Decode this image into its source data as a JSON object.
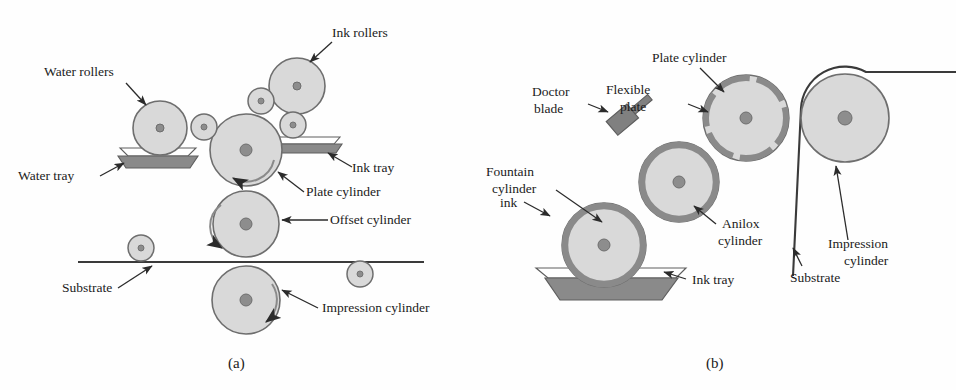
{
  "figure": {
    "type": "technical-diagram",
    "captions": {
      "a": "(a)",
      "b": "(b)"
    }
  },
  "colors": {
    "cylinder_fill": "#d9d9d9",
    "cylinder_stroke": "#6e6e6e",
    "hub": "#8d8d8d",
    "ink_dark": "#7a7a7a",
    "tray_dark": "#777777",
    "line": "#3a3a3a",
    "text": "#1b1b1b",
    "background": "#fefefe"
  },
  "panel_a": {
    "caption": "(a)",
    "title": "Offset lithographic press",
    "labels": [
      {
        "id": "water-rollers",
        "text": "Water rollers",
        "x": 44,
        "y": 76,
        "anchor": "start"
      },
      {
        "id": "ink-rollers",
        "text": "Ink rollers",
        "x": 332,
        "y": 37,
        "anchor": "start"
      },
      {
        "id": "water-tray",
        "text": "Water tray",
        "x": 18,
        "y": 180,
        "anchor": "start"
      },
      {
        "id": "ink-tray",
        "text": "Ink tray",
        "x": 352,
        "y": 172,
        "anchor": "start"
      },
      {
        "id": "plate-cylinder",
        "text": "Plate cylinder",
        "x": 306,
        "y": 196,
        "anchor": "start"
      },
      {
        "id": "offset-cylinder",
        "text": "Offset cylinder",
        "x": 330,
        "y": 224,
        "anchor": "start"
      },
      {
        "id": "substrate",
        "text": "Substrate",
        "x": 62,
        "y": 292,
        "anchor": "start"
      },
      {
        "id": "impression-cylinder",
        "text": "Impression cylinder",
        "x": 322,
        "y": 312,
        "anchor": "start"
      }
    ],
    "cylinders": [
      {
        "id": "water-roller-large",
        "cx": 160,
        "cy": 128,
        "r": 27,
        "hub": 4
      },
      {
        "id": "water-transfer-roller",
        "cx": 204,
        "cy": 127,
        "r": 13,
        "hub": 3
      },
      {
        "id": "plate-cylinder",
        "cx": 246,
        "cy": 150,
        "r": 36,
        "hub": 6
      },
      {
        "id": "ink-roller-large",
        "cx": 297,
        "cy": 86,
        "r": 28,
        "hub": 4
      },
      {
        "id": "ink-roller-small-left",
        "cx": 261,
        "cy": 101,
        "r": 13,
        "hub": 3
      },
      {
        "id": "ink-roller-small-low",
        "cx": 293,
        "cy": 125,
        "r": 13,
        "hub": 3
      },
      {
        "id": "offset-cylinder",
        "cx": 246,
        "cy": 224,
        "r": 33,
        "hub": 6
      },
      {
        "id": "impression-cylinder",
        "cx": 246,
        "cy": 300,
        "r": 34,
        "hub": 6
      },
      {
        "id": "guide-roller-left",
        "cx": 141,
        "cy": 245,
        "r": 13,
        "hub": 3
      },
      {
        "id": "guide-roller-right",
        "cx": 360,
        "cy": 272,
        "r": 13,
        "hub": 3
      }
    ],
    "substrate_line": {
      "x1": 78,
      "y1": 262,
      "x2": 424,
      "y2": 262
    },
    "trays": [
      {
        "id": "water-tray",
        "x": 122,
        "y": 148,
        "w": 72,
        "h": 16
      },
      {
        "id": "ink-tray",
        "x": 277,
        "y": 137,
        "w": 62,
        "h": 13
      }
    ]
  },
  "panel_b": {
    "caption": "(b)",
    "title": "Flexographic press",
    "labels": [
      {
        "id": "plate-cylinder",
        "text": "Plate cylinder",
        "x": 652,
        "y": 62,
        "anchor": "start"
      },
      {
        "id": "doctor-blade",
        "text": "Doctor blade",
        "x": 516,
        "y": 96,
        "anchor": "start"
      },
      {
        "id": "flexible-plate",
        "text": "Flexible plate",
        "x": 606,
        "y": 100,
        "anchor": "start"
      },
      {
        "id": "fountain-cylinder",
        "text": "Fountain cylinder",
        "x": 486,
        "y": 182,
        "anchor": "start"
      },
      {
        "id": "ink",
        "text": "ink",
        "x": 500,
        "y": 205,
        "anchor": "start"
      },
      {
        "id": "anilox-cylinder",
        "text": "Anilox cylinder",
        "x": 718,
        "y": 228,
        "anchor": "start"
      },
      {
        "id": "substrate",
        "text": "Substrate",
        "x": 796,
        "y": 270,
        "anchor": "start"
      },
      {
        "id": "impression-cylinder",
        "text": "Impression cylinder",
        "x": 832,
        "y": 248,
        "anchor": "start"
      },
      {
        "id": "ink-tray",
        "text": "Ink tray",
        "x": 690,
        "y": 283,
        "anchor": "start"
      }
    ],
    "cylinders": [
      {
        "id": "fountain-cylinder",
        "cx": 604,
        "cy": 245,
        "r": 42,
        "hub": 6,
        "ring": 7
      },
      {
        "id": "anilox-cylinder",
        "cx": 679,
        "cy": 182,
        "r": 40,
        "hub": 6,
        "ring": 7
      },
      {
        "id": "plate-cylinder",
        "cx": 746,
        "cy": 118,
        "r": 43,
        "hub": 6,
        "ring": 6
      },
      {
        "id": "impression-cylinder",
        "cx": 845,
        "cy": 118,
        "r": 44,
        "hub": 7,
        "ring": 0
      }
    ],
    "doctor_blade": {
      "cx": 622,
      "cy": 120,
      "w": 26,
      "h": 17,
      "rotation": -40
    },
    "ink_tray": {
      "x": 540,
      "y": 270,
      "w": 140,
      "h": 30
    }
  }
}
